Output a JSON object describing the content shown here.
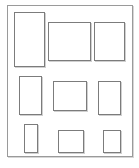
{
  "diagram": {
    "frame": {
      "x": 7,
      "y": 5,
      "w": 126,
      "h": 152
    },
    "stroke_color": "#7c7c7c",
    "frame_color": "#9a9a9a",
    "background": "#ffffff",
    "rows": [
      {
        "name": "row-1",
        "boxes": [
          {
            "name": "box-r1-c1",
            "x": 14,
            "y": 12,
            "w": 31,
            "h": 55
          },
          {
            "name": "box-r1-c2",
            "x": 48,
            "y": 22,
            "w": 43,
            "h": 39
          },
          {
            "name": "box-r1-c3",
            "x": 94,
            "y": 22,
            "w": 31,
            "h": 39
          }
        ]
      },
      {
        "name": "row-2",
        "boxes": [
          {
            "name": "box-r2-c1",
            "x": 19,
            "y": 76,
            "w": 23,
            "h": 39
          },
          {
            "name": "box-r2-c2",
            "x": 53,
            "y": 81,
            "w": 34,
            "h": 30
          },
          {
            "name": "box-r2-c3",
            "x": 98,
            "y": 81,
            "w": 23,
            "h": 34
          }
        ]
      },
      {
        "name": "row-3",
        "boxes": [
          {
            "name": "box-r3-c1",
            "x": 24,
            "y": 124,
            "w": 14,
            "h": 29
          },
          {
            "name": "box-r3-c2",
            "x": 58,
            "y": 130,
            "w": 26,
            "h": 23
          },
          {
            "name": "box-r3-c3",
            "x": 103,
            "y": 130,
            "w": 18,
            "h": 23
          }
        ]
      }
    ]
  }
}
